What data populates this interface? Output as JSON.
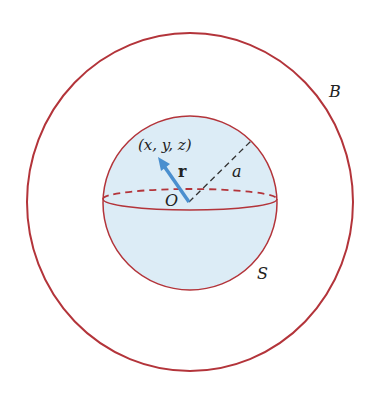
{
  "diagram": {
    "outer_region_label": "B",
    "sphere_label": "S",
    "point_label": "(x, y, z)",
    "vector_label": "r",
    "radius_label": "a",
    "origin_label": "O"
  },
  "colors": {
    "outline": "#b3343a",
    "sphere_fill": "#dcecf6",
    "vector": "#4a8fcf",
    "dashed_radius": "#333333"
  }
}
